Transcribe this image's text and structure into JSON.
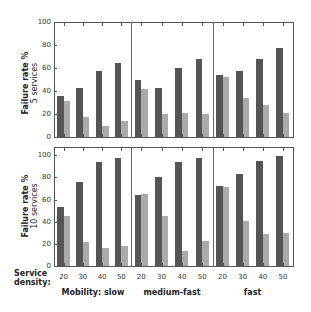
{
  "colors": {
    "coopc": "#555555",
    "gocomo": "#aaaaaa"
  },
  "legend": [
    {
      "label": "CoopC",
      "color": "#555555"
    },
    {
      "label": "GoCoMo",
      "color": "#aaaaaa"
    }
  ],
  "axes": {
    "row_labels": [
      {
        "line1": "Failure rate %",
        "line2": "5 services"
      },
      {
        "line1": "Failure rate %",
        "line2": "10 services"
      }
    ],
    "yticks": [
      "0",
      "20",
      "40",
      "60",
      "80",
      "100"
    ],
    "xtitle": {
      "line1": "Service",
      "line2": "density:"
    },
    "xticks": [
      "20",
      "30",
      "40",
      "50"
    ],
    "groups": [
      "Mobility: slow",
      "medium-fast",
      "fast"
    ]
  },
  "chart_data": {
    "type": "bar",
    "title": "",
    "ylabel": "Failure rate %",
    "xlabel": "Service density",
    "ylim": [
      0,
      100
    ],
    "categories": [
      "20",
      "30",
      "40",
      "50"
    ],
    "facets": {
      "rows": [
        "5 services",
        "10 services"
      ],
      "cols": [
        "Mobility: slow",
        "medium-fast",
        "fast"
      ]
    },
    "panels": [
      {
        "row": "5 services",
        "col": "Mobility: slow",
        "series": [
          {
            "name": "CoopC",
            "values": [
              36,
              43,
              57,
              64
            ]
          },
          {
            "name": "GoCoMo",
            "values": [
              31,
              17,
              10,
              14
            ]
          }
        ]
      },
      {
        "row": "5 services",
        "col": "medium-fast",
        "series": [
          {
            "name": "CoopC",
            "values": [
              50,
              43,
              60,
              68
            ]
          },
          {
            "name": "GoCoMo",
            "values": [
              42,
              20,
              21,
              20
            ]
          }
        ]
      },
      {
        "row": "5 services",
        "col": "fast",
        "series": [
          {
            "name": "CoopC",
            "values": [
              54,
              57,
              68,
              77
            ]
          },
          {
            "name": "GoCoMo",
            "values": [
              52,
              34,
              28,
              21
            ]
          }
        ]
      },
      {
        "row": "10 services",
        "col": "Mobility: slow",
        "series": [
          {
            "name": "CoopC",
            "values": [
              53,
              76,
              94,
              98
            ]
          },
          {
            "name": "GoCoMo",
            "values": [
              45,
              22,
              16,
              18
            ]
          }
        ]
      },
      {
        "row": "10 services",
        "col": "medium-fast",
        "series": [
          {
            "name": "CoopC",
            "values": [
              64,
              80,
              94,
              98
            ]
          },
          {
            "name": "GoCoMo",
            "values": [
              65,
              45,
              14,
              23
            ]
          }
        ]
      },
      {
        "row": "10 services",
        "col": "fast",
        "series": [
          {
            "name": "CoopC",
            "values": [
              72,
              83,
              95,
              99
            ]
          },
          {
            "name": "GoCoMo",
            "values": [
              71,
              41,
              29,
              30
            ]
          }
        ]
      }
    ],
    "legend_position": "top-right",
    "grid": false
  }
}
